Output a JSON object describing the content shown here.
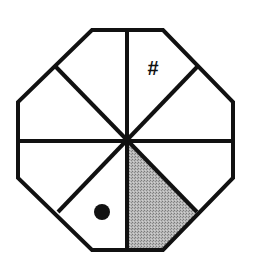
{
  "diagram": {
    "shape": "octagon",
    "sectors": 8,
    "stroke_color": "#111111",
    "fill_color": "#ffffff",
    "shade_color": "#a9a9a9",
    "symbols": {
      "hash": "#",
      "dot": "dot"
    },
    "shaded_sector": "lower-right-inner (south to south-east)",
    "hash_sector": "upper-right-inner (north to north-east)",
    "dot_sector": "lower-left-inner (south to south-west)"
  }
}
